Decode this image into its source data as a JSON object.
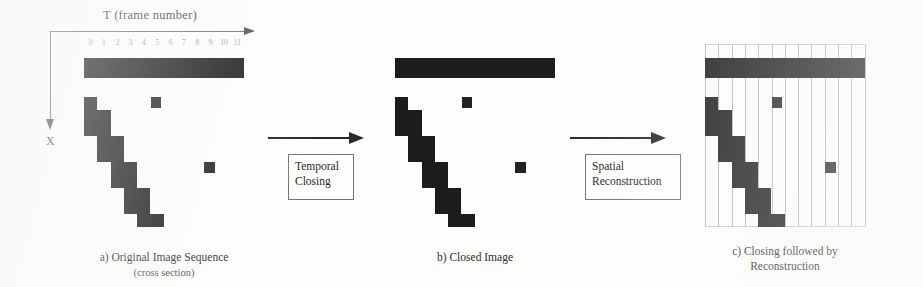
{
  "figure": {
    "axes": {
      "t_axis_label": "T (frame number)",
      "x_axis_label": "X",
      "t_ticks": [
        "0",
        "1",
        "2",
        "3",
        "4",
        "5",
        "6",
        "7",
        "8",
        "9",
        "10",
        "11"
      ]
    },
    "operations": [
      {
        "name": "temporal-closing",
        "line1": "Temporal",
        "line2": "Closing"
      },
      {
        "name": "spatial-reconstruction",
        "line1": "Spatial",
        "line2": "Reconstruction"
      }
    ],
    "captions": [
      {
        "label": "a) Original Image Sequence",
        "sub": "(cross section)"
      },
      {
        "label": "b) Closed Image",
        "sub": ""
      },
      {
        "label": "c) Closing followed by",
        "sub": "Reconstruction"
      }
    ],
    "colors": {
      "foreground": "#1d1c1b",
      "gridline": "#b9b7b2",
      "arrow": "#2b2a28",
      "text": "#262523",
      "background": "#fdfdfc"
    },
    "grid": {
      "columns": 12,
      "rows": 13,
      "cell_width": 13.3,
      "cell_height": 13.0
    },
    "panels": [
      {
        "name": "original-image-sequence",
        "gridlines": false,
        "blocks": [
          {
            "kind": "bar",
            "col": 0,
            "row": 0,
            "cols": 12,
            "rows": 1
          },
          {
            "kind": "staircase",
            "col": 0,
            "row": 3,
            "cols": 1,
            "rows": 1
          },
          {
            "kind": "staircase",
            "col": 0,
            "row": 4,
            "cols": 2,
            "rows": 1
          },
          {
            "kind": "staircase",
            "col": 0,
            "row": 5,
            "cols": 2,
            "rows": 1
          },
          {
            "kind": "staircase",
            "col": 1,
            "row": 6,
            "cols": 2,
            "rows": 1
          },
          {
            "kind": "staircase",
            "col": 1,
            "row": 7,
            "cols": 2,
            "rows": 1
          },
          {
            "kind": "staircase",
            "col": 2,
            "row": 8,
            "cols": 2,
            "rows": 1
          },
          {
            "kind": "staircase",
            "col": 2,
            "row": 9,
            "cols": 2,
            "rows": 1
          },
          {
            "kind": "staircase",
            "col": 3,
            "row": 10,
            "cols": 2,
            "rows": 1
          },
          {
            "kind": "staircase",
            "col": 3,
            "row": 11,
            "cols": 2,
            "rows": 1
          },
          {
            "kind": "staircase",
            "col": 4,
            "row": 12,
            "cols": 2,
            "rows": 1
          },
          {
            "kind": "spot",
            "col": 5,
            "row": 3,
            "cols": 1,
            "rows": 1
          },
          {
            "kind": "spot",
            "col": 9,
            "row": 8,
            "cols": 1,
            "rows": 1
          }
        ]
      },
      {
        "name": "closed-image",
        "gridlines": false,
        "blocks": [
          {
            "kind": "bar",
            "col": 0,
            "row": 0,
            "cols": 12,
            "rows": 1
          },
          {
            "kind": "staircase",
            "col": 0,
            "row": 3,
            "cols": 1,
            "rows": 1
          },
          {
            "kind": "staircase",
            "col": 0,
            "row": 4,
            "cols": 2,
            "rows": 1
          },
          {
            "kind": "staircase",
            "col": 0,
            "row": 5,
            "cols": 2,
            "rows": 1
          },
          {
            "kind": "staircase",
            "col": 1,
            "row": 6,
            "cols": 2,
            "rows": 1
          },
          {
            "kind": "staircase",
            "col": 1,
            "row": 7,
            "cols": 2,
            "rows": 1
          },
          {
            "kind": "staircase",
            "col": 2,
            "row": 8,
            "cols": 2,
            "rows": 1
          },
          {
            "kind": "staircase",
            "col": 2,
            "row": 9,
            "cols": 2,
            "rows": 1
          },
          {
            "kind": "staircase",
            "col": 3,
            "row": 10,
            "cols": 2,
            "rows": 1
          },
          {
            "kind": "staircase",
            "col": 3,
            "row": 11,
            "cols": 2,
            "rows": 1
          },
          {
            "kind": "staircase",
            "col": 4,
            "row": 12,
            "cols": 2,
            "rows": 1
          },
          {
            "kind": "spot",
            "col": 5,
            "row": 3,
            "cols": 1,
            "rows": 1
          },
          {
            "kind": "spot",
            "col": 9,
            "row": 8,
            "cols": 1,
            "rows": 1
          }
        ]
      },
      {
        "name": "closing-followed-by-reconstruction",
        "gridlines": true,
        "blocks": [
          {
            "kind": "bar",
            "col": 0,
            "row": 0,
            "cols": 12,
            "rows": 1
          },
          {
            "kind": "staircase",
            "col": 0,
            "row": 3,
            "cols": 1,
            "rows": 1
          },
          {
            "kind": "staircase",
            "col": 0,
            "row": 4,
            "cols": 2,
            "rows": 1
          },
          {
            "kind": "staircase",
            "col": 0,
            "row": 5,
            "cols": 2,
            "rows": 1
          },
          {
            "kind": "staircase",
            "col": 1,
            "row": 6,
            "cols": 2,
            "rows": 1
          },
          {
            "kind": "staircase",
            "col": 1,
            "row": 7,
            "cols": 2,
            "rows": 1
          },
          {
            "kind": "staircase",
            "col": 2,
            "row": 8,
            "cols": 2,
            "rows": 1
          },
          {
            "kind": "staircase",
            "col": 2,
            "row": 9,
            "cols": 2,
            "rows": 1
          },
          {
            "kind": "staircase",
            "col": 3,
            "row": 10,
            "cols": 2,
            "rows": 1
          },
          {
            "kind": "staircase",
            "col": 3,
            "row": 11,
            "cols": 2,
            "rows": 1
          },
          {
            "kind": "staircase",
            "col": 4,
            "row": 12,
            "cols": 2,
            "rows": 1
          },
          {
            "kind": "spot",
            "col": 5,
            "row": 3,
            "cols": 1,
            "rows": 1
          },
          {
            "kind": "spot",
            "col": 9,
            "row": 8,
            "cols": 1,
            "rows": 1
          }
        ]
      }
    ]
  }
}
